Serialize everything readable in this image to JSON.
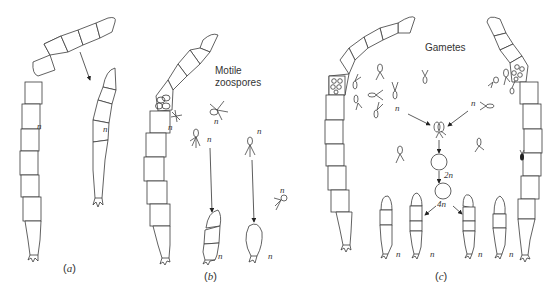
{
  "figure": {
    "panels": [
      {
        "id": "a",
        "label_open": "(",
        "label_letter": "a",
        "label_close": ")",
        "ploidy_labels": [
          "n",
          "n"
        ],
        "description": "Filament fragmentation"
      },
      {
        "id": "b",
        "label_open": "(",
        "label_letter": "b",
        "label_close": ")",
        "title": "Motile zoospores",
        "title_line1": "Motile",
        "title_line2": "zoospores",
        "ploidy_labels": [
          "n",
          "n",
          "n",
          "n",
          "n",
          "n",
          "n"
        ]
      },
      {
        "id": "c",
        "label_open": "(",
        "label_letter": "c",
        "label_close": ")",
        "title": "Gametes",
        "ploidy_labels": [
          "n",
          "n",
          "2n",
          "4n",
          "n",
          "n",
          "n",
          "n"
        ]
      }
    ],
    "zygote_labels": {
      "diploid": "2n",
      "tetraploid_arrow": "4n"
    },
    "colors": {
      "ink": "#3a3a3a",
      "background": "#ffffff"
    }
  }
}
